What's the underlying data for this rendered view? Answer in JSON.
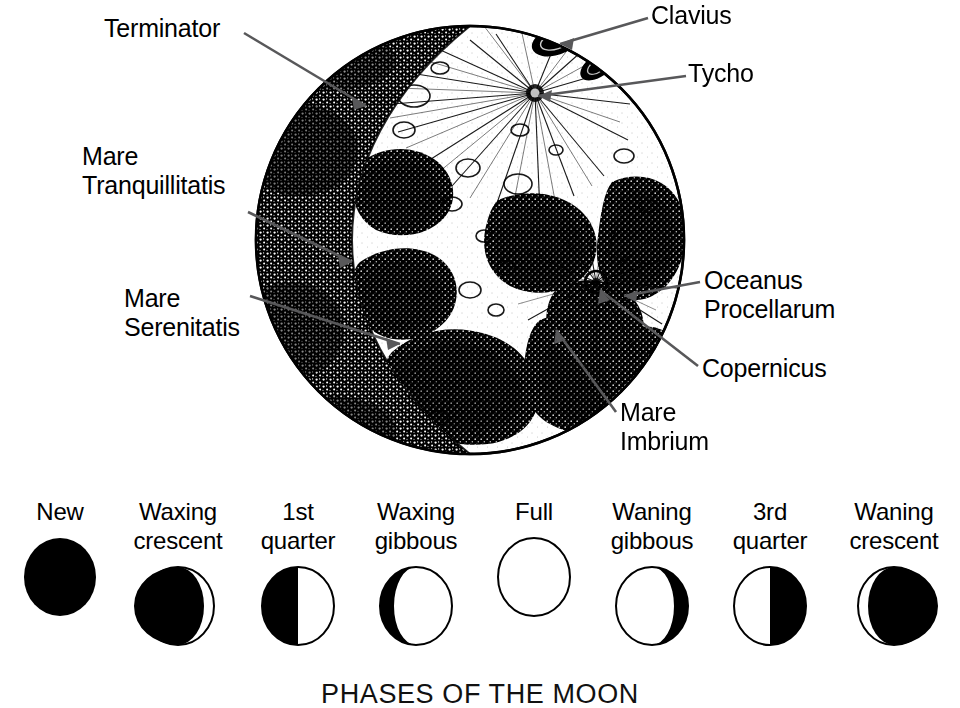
{
  "figure": {
    "caption": "PHASES OF THE MOON",
    "ink_color": "#000000",
    "background_color": "#ffffff",
    "leader_line_color": "#58585a"
  },
  "moon_map": {
    "labels": {
      "terminator": "Terminator",
      "mare_tranquillitatis": "Mare\nTranquillitatis",
      "mare_serenitatis": "Mare\nSerenitatis",
      "clavius": "Clavius",
      "tycho": "Tycho",
      "oceanus_procellarum": "Oceanus\nProcellarum",
      "copernicus": "Copernicus",
      "mare_imbrium": "Mare\nImbrium"
    }
  },
  "phases": [
    {
      "name": "New",
      "label": "New",
      "illumination_percent": 0,
      "lit_side": "none",
      "art": "new"
    },
    {
      "name": "Waxing crescent",
      "label": "Waxing\ncrescent",
      "illumination_percent": 12,
      "lit_side": "right",
      "art": "waxing-crescent"
    },
    {
      "name": "1st quarter",
      "label": "1st\nquarter",
      "illumination_percent": 50,
      "lit_side": "right",
      "art": "first-quarter"
    },
    {
      "name": "Waxing gibbous",
      "label": "Waxing\ngibbous",
      "illumination_percent": 88,
      "lit_side": "right",
      "art": "waxing-gibbous"
    },
    {
      "name": "Full",
      "label": "Full",
      "illumination_percent": 100,
      "lit_side": "all",
      "art": "full"
    },
    {
      "name": "Waning gibbous",
      "label": "Waning\ngibbous",
      "illumination_percent": 88,
      "lit_side": "left",
      "art": "waning-gibbous"
    },
    {
      "name": "3rd quarter",
      "label": "3rd\nquarter",
      "illumination_percent": 50,
      "lit_side": "left",
      "art": "third-quarter"
    },
    {
      "name": "Waning crescent",
      "label": "Waning\ncrescent",
      "illumination_percent": 12,
      "lit_side": "left",
      "art": "waning-crescent"
    }
  ]
}
